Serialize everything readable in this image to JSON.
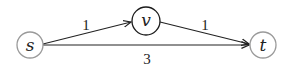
{
  "diagram": {
    "type": "directed-weighted-graph",
    "nodes": [
      {
        "id": "s",
        "label": "s",
        "cx": 30,
        "cy": 45,
        "r": 13,
        "stroke": "#9a9a9a"
      },
      {
        "id": "v",
        "label": "v",
        "cx": 146,
        "cy": 21,
        "r": 14,
        "stroke": "#1a1a1a"
      },
      {
        "id": "t",
        "label": "t",
        "cx": 263,
        "cy": 45,
        "r": 13,
        "stroke": "#9a9a9a"
      }
    ],
    "edges": [
      {
        "from": "s",
        "to": "v",
        "weight": "1",
        "label_x": 86,
        "label_y": 30
      },
      {
        "from": "v",
        "to": "t",
        "weight": "1",
        "label_x": 205,
        "label_y": 30
      },
      {
        "from": "s",
        "to": "t",
        "weight": "3",
        "label_x": 147,
        "label_y": 64
      }
    ],
    "edge_color": "#222222"
  }
}
